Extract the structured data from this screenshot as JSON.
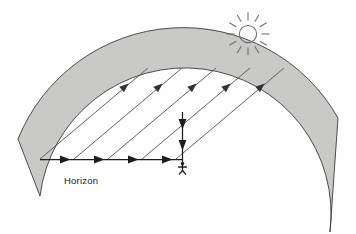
{
  "diagram": {
    "type": "schematic-diagram",
    "background_color": "#fefefe",
    "earth_band": {
      "name": "earth-surface-band",
      "fill_color": "#c9c9c7",
      "stroke_color": "#3a3a3a",
      "description": "Curved gray band representing the Earth's surface"
    },
    "horizon": {
      "label": "Horizon",
      "label_x": 64,
      "label_y": 182,
      "line_color": "#1d1d1d",
      "arrow_count": 4,
      "direction": "right",
      "start_x": 40,
      "end_x": 182,
      "y": 160
    },
    "sun": {
      "name": "sun-icon",
      "center_x": 248,
      "center_y": 34,
      "radius": 9,
      "ray_count": 12,
      "stroke_color": "#6e6e6e"
    },
    "sun_rays": {
      "name": "incoming-solar-rays",
      "count": 5,
      "direction": "down-left",
      "stroke_color": "#5a5a5a",
      "arrowhead_color": "#333333",
      "angle_degrees": 40
    },
    "vertical_ray": {
      "name": "vertical-incidence-line",
      "x": 182,
      "top_y": 112,
      "bottom_y": 162,
      "arrow_count": 2,
      "direction": "down",
      "color": "#1d1d1d"
    },
    "observer": {
      "name": "observer-figure",
      "x": 182,
      "y": 166,
      "color": "#1d1d1d",
      "description": "Stick figure standing at the horizon point"
    },
    "colors": {
      "band_fill": "#c9c9c7",
      "band_stroke": "#3a3a3a",
      "ray_stroke": "#5a5a5a",
      "arrow_fill": "#333333",
      "text": "#1d1d1d",
      "sun_stroke": "#6e6e6e"
    }
  }
}
